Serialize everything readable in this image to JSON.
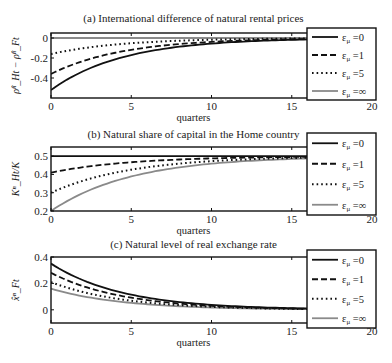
{
  "figure": {
    "legend_entries": [
      "ε_μ=0",
      "ε_μ=1",
      "ε_μ=5",
      "ε_μ=∞"
    ],
    "legend_labels": {
      "base": "ε",
      "sub": "μ",
      "vals": [
        "=0",
        "=1",
        "=5",
        "=∞"
      ]
    },
    "styles": [
      {
        "color": "#111111",
        "dash": "",
        "width": 1.8
      },
      {
        "color": "#111111",
        "dash": "6,3",
        "width": 1.8
      },
      {
        "color": "#111111",
        "dash": "1.6,3",
        "width": 2.0
      },
      {
        "color": "#8a8a8a",
        "dash": "",
        "width": 1.8
      }
    ],
    "xlabel": "quarters",
    "xticks": [
      0,
      5,
      10,
      15,
      20
    ]
  },
  "chart_data": [
    {
      "type": "line",
      "title": "(a) International difference of natural rental prices",
      "xlabel": "quarters",
      "ylabel": "ρ̂ⁿ_Ht − ρ̂ⁿ_Ft",
      "xlim": [
        0,
        20
      ],
      "ylim": [
        -0.6,
        0.05
      ],
      "yticks": [
        0,
        -0.2,
        -0.4
      ],
      "ytick_labels": [
        "0",
        "-0.2",
        "-0.4"
      ],
      "legend_position": "right-outside",
      "series": [
        {
          "name": "ε_μ=0",
          "start": -0.52,
          "end": 0,
          "decay": 0.8
        },
        {
          "name": "ε_μ=1",
          "start": -0.36,
          "end": 0,
          "decay": 0.8
        },
        {
          "name": "ε_μ=5",
          "start": -0.16,
          "end": 0,
          "decay": 0.8
        },
        {
          "name": "ε_μ=∞",
          "start": 0.0,
          "end": 0,
          "decay": 0.8
        }
      ]
    },
    {
      "type": "line",
      "title": "(b) Natural share of capital in the Home country",
      "xlabel": "quarters",
      "ylabel": "Kⁿ_Ht/K",
      "xlim": [
        0,
        20
      ],
      "ylim": [
        0.2,
        0.55
      ],
      "yticks": [
        0.2,
        0.3,
        0.4,
        0.5
      ],
      "ytick_labels": [
        "0.2",
        "0.3",
        "0.4",
        "0.5"
      ],
      "legend_position": "right-outside",
      "series": [
        {
          "name": "ε_μ=0",
          "start": 0.5,
          "end": 0.5,
          "decay": 0.8
        },
        {
          "name": "ε_μ=1",
          "start": 0.41,
          "end": 0.5,
          "decay": 0.82
        },
        {
          "name": "ε_μ=5",
          "start": 0.3,
          "end": 0.5,
          "decay": 0.82
        },
        {
          "name": "ε_μ=∞",
          "start": 0.2,
          "end": 0.5,
          "decay": 0.82
        }
      ]
    },
    {
      "type": "line",
      "title": "(c) Natural level of real exchange rate",
      "xlabel": "quarters",
      "ylabel": "x̂ⁿ_Ft",
      "xlim": [
        0,
        20
      ],
      "ylim": [
        -0.1,
        0.4
      ],
      "yticks": [
        0,
        0.2,
        0.4
      ],
      "ytick_labels": [
        "0",
        "0.2",
        "0.4"
      ],
      "legend_position": "right-outside",
      "series": [
        {
          "name": "ε_μ=0",
          "start": 0.35,
          "end": 0,
          "decay": 0.8
        },
        {
          "name": "ε_μ=1",
          "start": 0.28,
          "end": 0,
          "decay": 0.8
        },
        {
          "name": "ε_μ=5",
          "start": 0.21,
          "end": 0,
          "decay": 0.8
        },
        {
          "name": "ε_μ=∞",
          "start": 0.16,
          "end": 0,
          "decay": 0.8
        }
      ]
    }
  ]
}
